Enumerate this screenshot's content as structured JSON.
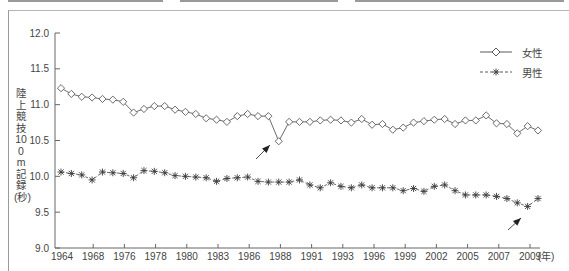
{
  "chart_data": {
    "type": "line",
    "title": "",
    "xlabel": "(年)",
    "ylabel": "陸上競技100m記録(秒)",
    "ylim": [
      9.0,
      12.0
    ],
    "yticks": [
      "9.0",
      "9.5",
      "10.0",
      "10.5",
      "11.0",
      "11.5",
      "12.0"
    ],
    "xtick_labels": [
      "1964",
      "1968",
      "1976",
      "1978",
      "1980",
      "1983",
      "1986",
      "1988",
      "1991",
      "1993",
      "1996",
      "1999",
      "2002",
      "2005",
      "2007",
      "2009"
    ],
    "x_unit": "(年)",
    "grid": false,
    "legend_position": "top-right",
    "series": [
      {
        "name": "女性",
        "marker": "diamond",
        "line": "solid",
        "values": [
          11.23,
          11.15,
          11.11,
          11.1,
          11.08,
          11.07,
          11.04,
          10.89,
          10.94,
          10.98,
          10.98,
          10.93,
          10.9,
          10.87,
          10.81,
          10.79,
          10.76,
          10.84,
          10.87,
          10.84,
          10.84,
          10.49,
          10.76,
          10.76,
          10.76,
          10.78,
          10.79,
          10.78,
          10.75,
          10.8,
          10.72,
          10.73,
          10.65,
          10.68,
          10.75,
          10.77,
          10.79,
          10.8,
          10.73,
          10.78,
          10.78,
          10.85,
          10.74,
          10.73,
          10.6,
          10.7,
          10.64
        ]
      },
      {
        "name": "男性",
        "marker": "asterisk",
        "line": "dashed",
        "values": [
          10.06,
          10.04,
          10.02,
          9.95,
          10.06,
          10.05,
          10.04,
          9.98,
          10.08,
          10.07,
          10.05,
          10.01,
          10.0,
          9.99,
          9.98,
          9.93,
          9.97,
          9.98,
          9.99,
          9.93,
          9.92,
          9.92,
          9.92,
          9.95,
          9.88,
          9.84,
          9.91,
          9.86,
          9.84,
          9.88,
          9.84,
          9.84,
          9.84,
          9.8,
          9.83,
          9.79,
          9.86,
          9.88,
          9.8,
          9.74,
          9.74,
          9.74,
          9.72,
          9.69,
          9.63,
          9.58,
          9.69
        ]
      }
    ],
    "annotations": [
      {
        "type": "arrow",
        "target_series": "女性",
        "description": "arrow pointing to dip near 1988"
      },
      {
        "type": "arrow",
        "target_series": "男性",
        "description": "arrow pointing to minimum near 2009"
      }
    ]
  },
  "legend": {
    "female_label": "女性",
    "male_label": "男性"
  },
  "axis": {
    "ylabel": "陸上競技100m記録(秒)",
    "x_unit": "(年)"
  },
  "colors": {
    "line": "#5a5a5a",
    "axis": "#666666",
    "text": "#444444",
    "arrow": "#222222"
  }
}
